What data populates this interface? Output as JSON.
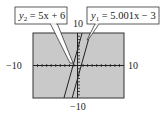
{
  "chart_data": {
    "type": "line",
    "title": "",
    "xlabel": "",
    "ylabel": "",
    "xlim": [
      -10,
      10
    ],
    "ylim": [
      -10,
      10
    ],
    "grid": false,
    "axis_ticks": "unit tick marks on both axes",
    "tick_labels": {
      "x_min": "−10",
      "x_max": "10",
      "y_min": "−10",
      "y_max": "10"
    },
    "series": [
      {
        "name": "y1",
        "label": "y₁ = 5.001x − 3",
        "slope": 5.001,
        "intercept": -3,
        "x": [
          -1.4,
          2.6
        ],
        "y": [
          -10,
          10
        ]
      },
      {
        "name": "y2",
        "label": "y₂ = 5x + 6",
        "slope": 5,
        "intercept": 6,
        "x": [
          -3.2,
          0.8
        ],
        "y": [
          -10,
          10
        ]
      }
    ],
    "annotations": [
      {
        "text": "y₂ = 5x + 6",
        "position": "top-left callout"
      },
      {
        "text": "y₁ = 5.001x − 3",
        "position": "top-right callout"
      }
    ],
    "background": "#c9c9c9"
  },
  "labels": {
    "x_min": "−10",
    "x_max": "10",
    "y_min": "−10",
    "y_max": "10",
    "y2_prefix": "y",
    "y2_sub": "2",
    "y2_rest": " = 5x + 6",
    "y1_prefix": "y",
    "y1_sub": "1",
    "y1_rest": " = 5.001x − 3"
  }
}
